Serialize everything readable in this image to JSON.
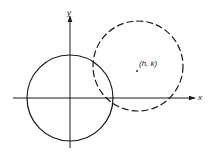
{
  "diagram": {
    "axes": {
      "x_label": "x",
      "y_label": "y",
      "origin": [
        70,
        98
      ]
    },
    "circles": [
      {
        "name": "circle-at-origin",
        "center": [
          70,
          98
        ],
        "radius": 43,
        "style": "solid"
      },
      {
        "name": "translated-circle",
        "center": [
          138,
          66
        ],
        "radius": 45,
        "style": "dashed"
      }
    ],
    "center_point": {
      "label": "(h, k)",
      "position": [
        137,
        70
      ]
    },
    "colors": {
      "stroke": "#1a1a1a",
      "background": "#ffffff"
    }
  }
}
